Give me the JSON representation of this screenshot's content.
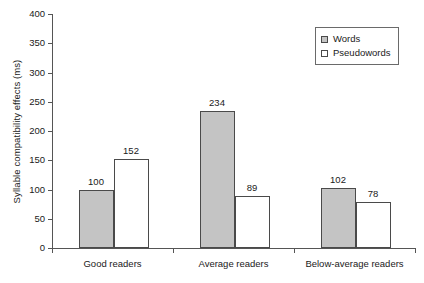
{
  "chart_data": {
    "type": "bar",
    "title": "",
    "xlabel": "",
    "ylabel": "Syllable compatibility effects (ms)",
    "ylim": [
      0,
      400
    ],
    "ytick_labels": [
      "0",
      "50",
      "100",
      "150",
      "200",
      "250",
      "300",
      "350",
      "400"
    ],
    "ytick_values": [
      0,
      50,
      100,
      150,
      200,
      250,
      300,
      350,
      400
    ],
    "grid": false,
    "categories": [
      "Good readers",
      "Average readers",
      "Below-average readers"
    ],
    "legend_position": "top-right",
    "series": [
      {
        "name": "Words",
        "color": "#c4c4c4",
        "values": [
          100,
          234,
          102
        ],
        "value_labels": [
          "100",
          "234",
          "102"
        ]
      },
      {
        "name": "Pseudowords",
        "color": "#ffffff",
        "values": [
          152,
          89,
          78
        ],
        "value_labels": [
          "152",
          "89",
          "78"
        ]
      }
    ]
  },
  "legend": {
    "items": [
      {
        "label": "Words",
        "swatch": "words"
      },
      {
        "label": "Pseudowords",
        "swatch": "pseudowords"
      }
    ]
  },
  "colors": {
    "words_fill": "#c4c4c4",
    "pseudowords_fill": "#ffffff",
    "bar_outline": "#4a4a4a",
    "axis": "#555555",
    "text": "#1a1a1a"
  }
}
